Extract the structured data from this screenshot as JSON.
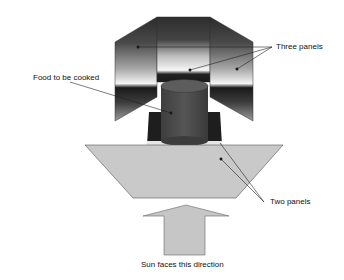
{
  "diagram": {
    "labels": {
      "three_panels": "Three panels",
      "food": "Food to be cooked",
      "two_panels": "Two panels",
      "sun": "Sun faces this direction"
    },
    "colors": {
      "background": "#ffffff",
      "panel_dark": "#2a2a2a",
      "panel_light": "#f2f2f2",
      "cylinder": "#4a4a4a",
      "cylinder_top": "#5a5a5a",
      "trapezoid": "#c8c8c8",
      "arrow": "#c6c6c6",
      "outline": "#555555",
      "leader": "#222222"
    }
  }
}
